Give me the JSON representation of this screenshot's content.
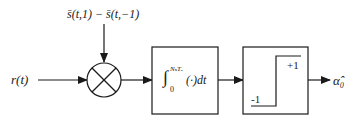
{
  "diagram": {
    "type": "block-diagram",
    "nodes": [
      {
        "id": "input",
        "label": "r(t)"
      },
      {
        "id": "reference",
        "label": "s̄(t,1) − s̄(t,−1)"
      },
      {
        "id": "multiplier",
        "label": "×",
        "shape": "circle"
      },
      {
        "id": "integrator",
        "label_prefix": "∫",
        "upper_limit": "NₛTₑ",
        "lower_limit": "0",
        "integrand": "(·)dt",
        "shape": "box"
      },
      {
        "id": "decision",
        "shape": "box",
        "levels": {
          "high": "+1",
          "low": "-1"
        }
      },
      {
        "id": "output",
        "label": "α̂₀"
      }
    ],
    "edges": [
      {
        "from": "input",
        "to": "multiplier"
      },
      {
        "from": "reference",
        "to": "multiplier"
      },
      {
        "from": "multiplier",
        "to": "integrator"
      },
      {
        "from": "integrator",
        "to": "decision"
      },
      {
        "from": "decision",
        "to": "output"
      }
    ]
  },
  "labels": {
    "input": "r(t)",
    "reference": "s̄(t,1) − s̄(t,−1)",
    "integral_sign": "∫",
    "integral_upper": "NₛTₑ",
    "integral_lower": "0",
    "integrand": "(·)dt",
    "decision_high": "+1",
    "decision_low": "-1",
    "output": "α̂₀"
  },
  "colors": {
    "stroke": "#1a1a1a",
    "background": "#ffffff"
  }
}
